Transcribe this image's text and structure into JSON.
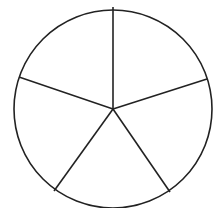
{
  "diagram": {
    "type": "circle-divided-into-sectors",
    "sector_count": 5,
    "stroke_color": "#222222",
    "fill_color": "#ffffff",
    "center": [
      113,
      109
    ],
    "radius": 99,
    "spokes": [
      {
        "x": 113,
        "y": 7
      },
      {
        "x": 207,
        "y": 79
      },
      {
        "x": 170,
        "y": 192
      },
      {
        "x": 54,
        "y": 191
      },
      {
        "x": 19,
        "y": 77
      }
    ]
  }
}
